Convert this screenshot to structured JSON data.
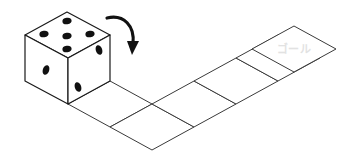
{
  "scene": {
    "title": "dice-rolling-path-puzzle",
    "background_color": "#ffffff",
    "width": 342,
    "height": 159
  },
  "die": {
    "name": "die",
    "top_face": {
      "label": "5",
      "pips": 5
    },
    "left_face": {
      "label": "1",
      "pips": 1
    },
    "right_face": {
      "label": "2",
      "pips": 2
    },
    "pip_color": "#111111",
    "face_color": "#ffffff",
    "edge_color": "#1a1a1a"
  },
  "arrow": {
    "name": "roll-direction-arrow",
    "direction": "clockwise-down-right",
    "color": "#111111"
  },
  "path": {
    "name": "tile-path",
    "tile_count": 6,
    "tile_fill": "#ffffff",
    "tile_stroke": "#3a3a3a",
    "tiles": [
      {
        "index": 1,
        "label": ""
      },
      {
        "index": 2,
        "label": ""
      },
      {
        "index": 3,
        "label": ""
      },
      {
        "index": 4,
        "label": ""
      },
      {
        "index": 5,
        "label": ""
      },
      {
        "index": 6,
        "label": "ゴール"
      }
    ]
  },
  "goal": {
    "name": "goal-tile-label",
    "text": "ゴール",
    "color": "#e2e2e2"
  }
}
